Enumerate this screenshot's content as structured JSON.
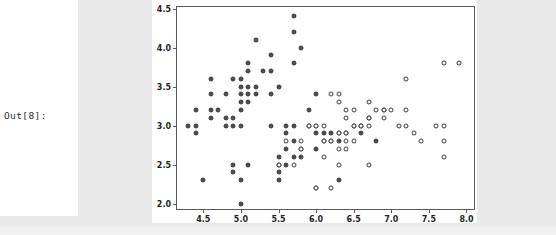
{
  "notebook": {
    "out_prompt": "Out[8]:"
  },
  "chart_data": {
    "type": "scatter",
    "title": "",
    "xlabel": "",
    "ylabel": "",
    "xlim": [
      4.15,
      8.1
    ],
    "ylim": [
      1.93,
      4.52
    ],
    "xticks": [
      "4.5",
      "5.0",
      "5.5",
      "6.0",
      "6.5",
      "7.0",
      "7.5",
      "8.0"
    ],
    "xtick_values": [
      4.5,
      5.0,
      5.5,
      6.0,
      6.5,
      7.0,
      7.5,
      8.0
    ],
    "yticks": [
      "2.0",
      "2.5",
      "3.0",
      "3.5",
      "4.0",
      "4.5"
    ],
    "ytick_values": [
      2.0,
      2.5,
      3.0,
      3.5,
      4.0,
      4.5
    ],
    "grid": false,
    "legend": "none",
    "marker_size_px": 5,
    "colors": {
      "filled_marker": "#4d4d4d",
      "hollow_marker": "#ffffff",
      "marker_edge": "#3a3a3a",
      "axis_spine": "#5a5a5a",
      "figure_bg": "#ffffff",
      "page_bg": "#e9e9e9"
    },
    "series": [
      {
        "name": "filled",
        "marker": "filled-circle",
        "points": [
          [
            4.3,
            3.0
          ],
          [
            4.4,
            3.0
          ],
          [
            4.4,
            3.2
          ],
          [
            4.4,
            2.9
          ],
          [
            4.5,
            2.3
          ],
          [
            4.6,
            3.1
          ],
          [
            4.6,
            3.4
          ],
          [
            4.6,
            3.6
          ],
          [
            4.6,
            3.2
          ],
          [
            4.7,
            3.2
          ],
          [
            4.8,
            3.0
          ],
          [
            4.8,
            3.1
          ],
          [
            4.8,
            3.4
          ],
          [
            4.9,
            3.0
          ],
          [
            4.9,
            3.1
          ],
          [
            4.9,
            3.6
          ],
          [
            4.9,
            2.4
          ],
          [
            4.9,
            2.5
          ],
          [
            5.0,
            3.0
          ],
          [
            5.0,
            3.2
          ],
          [
            5.0,
            3.3
          ],
          [
            5.0,
            3.4
          ],
          [
            5.0,
            3.5
          ],
          [
            5.0,
            3.6
          ],
          [
            5.0,
            2.3
          ],
          [
            5.0,
            2.0
          ],
          [
            5.1,
            3.3
          ],
          [
            5.1,
            3.4
          ],
          [
            5.1,
            3.5
          ],
          [
            5.1,
            3.7
          ],
          [
            5.1,
            3.8
          ],
          [
            5.1,
            2.5
          ],
          [
            5.2,
            3.4
          ],
          [
            5.2,
            3.5
          ],
          [
            5.2,
            4.1
          ],
          [
            5.3,
            3.7
          ],
          [
            5.4,
            3.4
          ],
          [
            5.4,
            3.7
          ],
          [
            5.4,
            3.9
          ],
          [
            5.4,
            3.0
          ],
          [
            5.5,
            3.5
          ],
          [
            5.5,
            2.3
          ],
          [
            5.5,
            2.4
          ],
          [
            5.5,
            2.5
          ],
          [
            5.5,
            2.6
          ],
          [
            5.6,
            3.0
          ],
          [
            5.6,
            2.5
          ],
          [
            5.6,
            2.7
          ],
          [
            5.6,
            2.9
          ],
          [
            5.7,
            4.4
          ],
          [
            5.7,
            4.2
          ],
          [
            5.7,
            3.8
          ],
          [
            5.7,
            3.0
          ],
          [
            5.7,
            2.6
          ],
          [
            5.7,
            2.8
          ],
          [
            5.8,
            4.0
          ],
          [
            5.8,
            2.6
          ],
          [
            5.8,
            2.7
          ],
          [
            5.9,
            3.2
          ],
          [
            5.9,
            3.0
          ],
          [
            6.0,
            3.4
          ],
          [
            6.0,
            2.9
          ],
          [
            6.0,
            2.7
          ],
          [
            6.1,
            2.9
          ],
          [
            6.1,
            2.8
          ],
          [
            6.2,
            2.9
          ],
          [
            6.2,
            2.8
          ],
          [
            6.3,
            2.9
          ],
          [
            6.3,
            2.8
          ],
          [
            6.3,
            2.3
          ],
          [
            6.4,
            2.9
          ],
          [
            6.5,
            3.0
          ],
          [
            6.6,
            3.0
          ],
          [
            6.6,
            2.9
          ],
          [
            6.7,
            3.1
          ],
          [
            6.9,
            3.2
          ],
          [
            6.8,
            2.8
          ]
        ]
      },
      {
        "name": "hollow",
        "marker": "open-circle",
        "points": [
          [
            5.5,
            2.5
          ],
          [
            5.7,
            2.5
          ],
          [
            5.8,
            2.8
          ],
          [
            5.9,
            3.0
          ],
          [
            6.0,
            3.0
          ],
          [
            6.0,
            2.2
          ],
          [
            6.1,
            3.0
          ],
          [
            6.1,
            2.6
          ],
          [
            6.2,
            3.4
          ],
          [
            6.2,
            2.2
          ],
          [
            6.3,
            3.3
          ],
          [
            6.3,
            3.4
          ],
          [
            6.3,
            2.5
          ],
          [
            6.3,
            2.7
          ],
          [
            6.4,
            3.2
          ],
          [
            6.4,
            3.1
          ],
          [
            6.4,
            2.7
          ],
          [
            6.4,
            2.8
          ],
          [
            6.5,
            3.0
          ],
          [
            6.5,
            2.8
          ],
          [
            6.6,
            3.0
          ],
          [
            6.7,
            3.3
          ],
          [
            6.7,
            3.1
          ],
          [
            6.7,
            3.0
          ],
          [
            6.7,
            2.5
          ],
          [
            6.8,
            3.2
          ],
          [
            6.9,
            3.1
          ],
          [
            6.9,
            3.2
          ],
          [
            7.0,
            3.2
          ],
          [
            7.1,
            3.0
          ],
          [
            7.2,
            3.6
          ],
          [
            7.2,
            3.2
          ],
          [
            7.2,
            3.0
          ],
          [
            7.3,
            2.9
          ],
          [
            7.4,
            2.8
          ],
          [
            7.6,
            3.0
          ],
          [
            7.7,
            3.8
          ],
          [
            7.7,
            3.0
          ],
          [
            7.7,
            2.8
          ],
          [
            7.7,
            2.6
          ],
          [
            7.9,
            3.8
          ],
          [
            5.8,
            2.7
          ],
          [
            6.0,
            2.2
          ],
          [
            6.1,
            2.8
          ],
          [
            6.2,
            2.8
          ],
          [
            6.3,
            2.9
          ],
          [
            6.4,
            2.9
          ],
          [
            6.5,
            3.2
          ],
          [
            6.0,
            3.0
          ],
          [
            5.6,
            2.8
          ]
        ]
      }
    ]
  }
}
